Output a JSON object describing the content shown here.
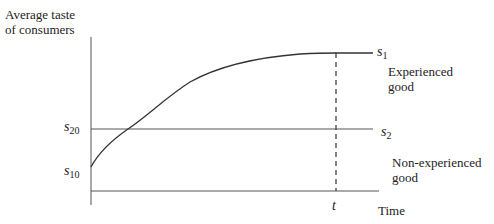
{
  "diagram": {
    "y_axis_label": "Average taste of consumers",
    "x_axis_label": "Time",
    "time_marker": "t",
    "labels": {
      "s1": {
        "base": "s",
        "sub": "1"
      },
      "s2": {
        "base": "s",
        "sub": "2"
      },
      "s20": {
        "base": "s",
        "sub": "20"
      },
      "s10": {
        "base": "s",
        "sub": "10"
      }
    },
    "experienced_good": "Experienced good",
    "non_experienced_good": "Non-experienced good"
  },
  "colors": {
    "line": "#333333",
    "text": "#222222",
    "background": "#ffffff"
  }
}
